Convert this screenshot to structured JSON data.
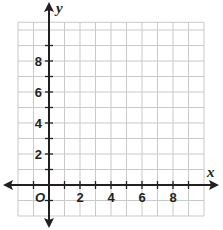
{
  "chart_data": {
    "type": "line",
    "title": "",
    "xlabel": "x",
    "ylabel": "y",
    "origin_label": "O",
    "xlim": [
      -2,
      10
    ],
    "ylim": [
      -2,
      10.5
    ],
    "grid": true,
    "grid_step": 1,
    "x_ticks": [
      -1,
      1,
      2,
      3,
      4,
      5,
      6,
      7,
      8,
      9
    ],
    "y_ticks": [
      -1,
      1,
      2,
      3,
      4,
      5,
      6,
      7,
      8,
      9
    ],
    "x_tick_labels": [
      "2",
      "4",
      "6",
      "8"
    ],
    "x_tick_label_values": [
      2,
      4,
      6,
      8
    ],
    "y_tick_labels": [
      "2",
      "4",
      "6",
      "8"
    ],
    "y_tick_label_values": [
      2,
      4,
      6,
      8
    ],
    "series": [],
    "axis_arrows": true,
    "legend": null
  },
  "colors": {
    "grid": "#c9c9c9",
    "axis": "#231f20",
    "background": "#ffffff"
  }
}
